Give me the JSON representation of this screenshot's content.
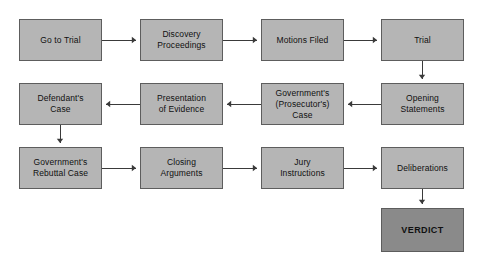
{
  "diagram": {
    "background_color": "#ffffff",
    "node_fill": "#b5b5b5",
    "terminal_fill": "#8a8a8a",
    "node_border": "#5d5d5d",
    "connector_color": "#3a3a3a",
    "text_color": "#101010"
  },
  "nodes": [
    {
      "id": "go-to-trial",
      "label": "Go to Trial",
      "row": 1,
      "col": 1,
      "x": 19,
      "y": 19,
      "w": 83,
      "h": 42,
      "terminal": false
    },
    {
      "id": "discovery-proceedings",
      "label": "Discovery\nProceedings",
      "row": 1,
      "col": 2,
      "x": 140,
      "y": 19,
      "w": 83,
      "h": 42,
      "terminal": false
    },
    {
      "id": "motions-filed",
      "label": "Motions Filed",
      "row": 1,
      "col": 3,
      "x": 261,
      "y": 19,
      "w": 83,
      "h": 42,
      "terminal": false
    },
    {
      "id": "trial",
      "label": "Trial",
      "row": 1,
      "col": 4,
      "x": 381,
      "y": 19,
      "w": 83,
      "h": 42,
      "terminal": false
    },
    {
      "id": "defendants-case",
      "label": "Defendant's\nCase",
      "row": 2,
      "col": 1,
      "x": 19,
      "y": 83,
      "w": 83,
      "h": 42,
      "terminal": false
    },
    {
      "id": "presentation-evidence",
      "label": "Presentation\nof Evidence",
      "row": 2,
      "col": 2,
      "x": 140,
      "y": 83,
      "w": 83,
      "h": 42,
      "terminal": false
    },
    {
      "id": "governments-case",
      "label": "Government's\n(Prosecutor's)\nCase",
      "row": 2,
      "col": 3,
      "x": 261,
      "y": 83,
      "w": 83,
      "h": 42,
      "terminal": false
    },
    {
      "id": "opening-statements",
      "label": "Opening\nStatements",
      "row": 2,
      "col": 4,
      "x": 381,
      "y": 83,
      "w": 83,
      "h": 42,
      "terminal": false
    },
    {
      "id": "governments-rebuttal",
      "label": "Government's\nRebuttal Case",
      "row": 3,
      "col": 1,
      "x": 19,
      "y": 147,
      "w": 83,
      "h": 42,
      "terminal": false
    },
    {
      "id": "closing-arguments",
      "label": "Closing\nArguments",
      "row": 3,
      "col": 2,
      "x": 140,
      "y": 147,
      "w": 83,
      "h": 42,
      "terminal": false
    },
    {
      "id": "jury-instructions",
      "label": "Jury\nInstructions",
      "row": 3,
      "col": 3,
      "x": 261,
      "y": 147,
      "w": 83,
      "h": 42,
      "terminal": false
    },
    {
      "id": "deliberations",
      "label": "Deliberations",
      "row": 3,
      "col": 4,
      "x": 381,
      "y": 147,
      "w": 83,
      "h": 42,
      "terminal": false
    },
    {
      "id": "verdict",
      "label": "VERDICT",
      "row": 4,
      "col": 4,
      "x": 381,
      "y": 208,
      "w": 83,
      "h": 44,
      "terminal": true
    }
  ],
  "connectors": [
    {
      "id": "go-to-trial--discovery-proceedings",
      "from": "go-to-trial",
      "to": "discovery-proceedings",
      "direction": "right",
      "path": "M102,40 L136,40",
      "arrow": "136,40"
    },
    {
      "id": "discovery-proceedings--motions-filed",
      "from": "discovery-proceedings",
      "to": "motions-filed",
      "direction": "right",
      "path": "M223,40 L257,40",
      "arrow": "257,40"
    },
    {
      "id": "motions-filed--trial",
      "from": "motions-filed",
      "to": "trial",
      "direction": "right",
      "path": "M344,40 L377,40",
      "arrow": "377,40"
    },
    {
      "id": "trial--opening-statements",
      "from": "trial",
      "to": "opening-statements",
      "direction": "down",
      "path": "M422,61 L422,79",
      "arrow": "422,79"
    },
    {
      "id": "opening-statements--governments-case",
      "from": "opening-statements",
      "to": "governments-case",
      "direction": "left",
      "path": "M381,104 L348,104",
      "arrow": "348,104"
    },
    {
      "id": "governments-case--presentation-evidence",
      "from": "governments-case",
      "to": "presentation-evidence",
      "direction": "left",
      "path": "M261,104 L227,104",
      "arrow": "227,104"
    },
    {
      "id": "presentation-evidence--defendants-case",
      "from": "presentation-evidence",
      "to": "defendants-case",
      "direction": "left",
      "path": "M140,104 L106,104",
      "arrow": "106,104"
    },
    {
      "id": "defendants-case--governments-rebuttal",
      "from": "defendants-case",
      "to": "governments-rebuttal",
      "direction": "down",
      "path": "M60,125 L60,143",
      "arrow": "60,143"
    },
    {
      "id": "governments-rebuttal--closing-arguments",
      "from": "governments-rebuttal",
      "to": "closing-arguments",
      "direction": "right",
      "path": "M102,168 L136,168",
      "arrow": "136,168"
    },
    {
      "id": "closing-arguments--jury-instructions",
      "from": "closing-arguments",
      "to": "jury-instructions",
      "direction": "right",
      "path": "M223,168 L257,168",
      "arrow": "257,168"
    },
    {
      "id": "jury-instructions--deliberations",
      "from": "jury-instructions",
      "to": "deliberations",
      "direction": "right",
      "path": "M344,168 L377,168",
      "arrow": "377,168"
    },
    {
      "id": "deliberations--verdict",
      "from": "deliberations",
      "to": "verdict",
      "direction": "down",
      "path": "M422,189 L422,204",
      "arrow": "422,204"
    }
  ]
}
